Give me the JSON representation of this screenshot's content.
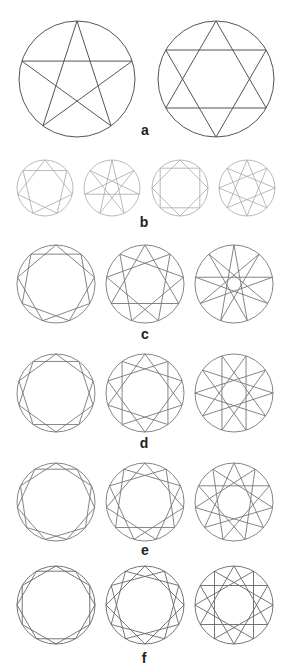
{
  "figure": {
    "width": 290,
    "height": 672,
    "background": "#ffffff",
    "rows": [
      {
        "label": "a",
        "label_pos": [
          145,
          130
        ],
        "stroke": "#555555",
        "stroke_width": 1,
        "shapes": [
          {
            "name": "pentagram",
            "n": 5,
            "k": 2,
            "cx": 77,
            "cy": 79,
            "r": 58,
            "rotation": 0
          },
          {
            "name": "hexagram",
            "n": 6,
            "k": 2,
            "cx": 216,
            "cy": 79,
            "r": 58,
            "rotation": 0
          }
        ]
      },
      {
        "label": "b",
        "label_pos": [
          144,
          222
        ],
        "stroke": "#a8a8a8",
        "stroke_width": 0.8,
        "shapes": [
          {
            "name": "heptagram-7-2",
            "n": 7,
            "k": 2,
            "cx": 45,
            "cy": 188,
            "r": 28,
            "rotation": 0
          },
          {
            "name": "heptagram-7-3",
            "n": 7,
            "k": 3,
            "cx": 112,
            "cy": 188,
            "r": 28,
            "rotation": 0
          },
          {
            "name": "octagram-8-2",
            "n": 8,
            "k": 2,
            "cx": 180,
            "cy": 188,
            "r": 28,
            "rotation": 0
          },
          {
            "name": "octagram-8-3",
            "n": 8,
            "k": 3,
            "cx": 247,
            "cy": 188,
            "r": 28,
            "rotation": 0
          }
        ]
      },
      {
        "label": "c",
        "label_pos": [
          145,
          334
        ],
        "stroke": "#777777",
        "stroke_width": 0.9,
        "shapes": [
          {
            "name": "enneagram-9-2",
            "n": 9,
            "k": 2,
            "cx": 56,
            "cy": 284,
            "r": 39,
            "rotation": 0
          },
          {
            "name": "enneagram-9-3",
            "n": 9,
            "k": 3,
            "cx": 145,
            "cy": 284,
            "r": 39,
            "rotation": 0
          },
          {
            "name": "enneagram-9-4",
            "n": 9,
            "k": 4,
            "cx": 234,
            "cy": 284,
            "r": 39,
            "rotation": 0
          }
        ]
      },
      {
        "label": "d",
        "label_pos": [
          144,
          443
        ],
        "stroke": "#777777",
        "stroke_width": 0.9,
        "shapes": [
          {
            "name": "decagram-10-2",
            "n": 10,
            "k": 2,
            "cx": 56,
            "cy": 393,
            "r": 39,
            "rotation": 0
          },
          {
            "name": "decagram-10-3",
            "n": 10,
            "k": 3,
            "cx": 145,
            "cy": 393,
            "r": 39,
            "rotation": 0
          },
          {
            "name": "decagram-10-4",
            "n": 10,
            "k": 4,
            "cx": 234,
            "cy": 393,
            "r": 39,
            "rotation": 18
          }
        ]
      },
      {
        "label": "e",
        "label_pos": [
          145,
          550
        ],
        "stroke": "#777777",
        "stroke_width": 0.9,
        "shapes": [
          {
            "name": "hendecagram-11-2",
            "n": 11,
            "k": 2,
            "cx": 56,
            "cy": 502,
            "r": 39,
            "rotation": 0
          },
          {
            "name": "hendecagram-11-3",
            "n": 11,
            "k": 3,
            "cx": 145,
            "cy": 502,
            "r": 39,
            "rotation": 0
          },
          {
            "name": "hendecagram-11-4",
            "n": 11,
            "k": 4,
            "cx": 234,
            "cy": 502,
            "r": 39,
            "rotation": 0
          }
        ]
      },
      {
        "label": "f",
        "label_pos": [
          144,
          658
        ],
        "stroke": "#666666",
        "stroke_width": 0.9,
        "shapes": [
          {
            "name": "dodecagram-12-2",
            "n": 12,
            "k": 2,
            "cx": 56,
            "cy": 605,
            "r": 39,
            "rotation": 0
          },
          {
            "name": "dodecagram-12-3",
            "n": 12,
            "k": 3,
            "cx": 145,
            "cy": 605,
            "r": 39,
            "rotation": 0
          },
          {
            "name": "dodecagram-12-4",
            "n": 12,
            "k": 4,
            "cx": 234,
            "cy": 605,
            "r": 39,
            "rotation": 0
          }
        ]
      }
    ]
  }
}
